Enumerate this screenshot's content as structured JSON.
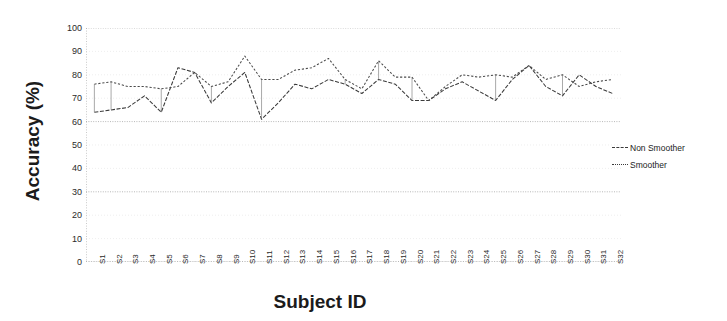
{
  "chart_data": {
    "type": "line",
    "title": "",
    "xlabel": "Subject ID",
    "ylabel": "Accuracy (%)",
    "ylim": [
      0,
      100
    ],
    "ytick_step": 10,
    "yticks": [
      100,
      90,
      80,
      70,
      60,
      50,
      40,
      30,
      20,
      10,
      0
    ],
    "grid": true,
    "grid_orientation": "horizontal",
    "legend_position": "right",
    "categories": [
      "S1",
      "S2",
      "S3",
      "S4",
      "S5",
      "S6",
      "S7",
      "S8",
      "S9",
      "S10",
      "S11",
      "S12",
      "S13",
      "S14",
      "S15",
      "S16",
      "S17",
      "S18",
      "S19",
      "S20",
      "S21",
      "S22",
      "S23",
      "S24",
      "S25",
      "S26",
      "S27",
      "S28",
      "S29",
      "S30",
      "S31",
      "S32"
    ],
    "series": [
      {
        "name": "Non Smoother",
        "style": "dashed",
        "color": "#3a3a3a",
        "values": [
          64,
          65,
          66,
          71,
          64,
          83,
          81,
          68,
          75,
          81,
          61,
          68,
          76,
          74,
          78,
          76,
          72,
          78,
          76,
          69,
          69,
          74,
          77,
          73,
          69,
          78,
          84,
          75,
          71,
          80,
          75,
          72
        ]
      },
      {
        "name": "Smoother",
        "style": "dotted",
        "color": "#4a4a4a",
        "values": [
          76,
          77,
          75,
          75,
          74,
          75,
          81,
          75,
          77,
          88,
          78,
          78,
          82,
          83,
          87,
          78,
          74,
          86,
          79,
          79,
          69,
          75,
          80,
          79,
          80,
          79,
          84,
          78,
          80,
          75,
          77,
          78
        ]
      }
    ]
  },
  "legend": {
    "items": [
      {
        "label": "Non Smoother"
      },
      {
        "label": "Smoother"
      }
    ]
  },
  "axes": {
    "x_title": "Subject ID",
    "y_title": "Accuracy (%)"
  }
}
